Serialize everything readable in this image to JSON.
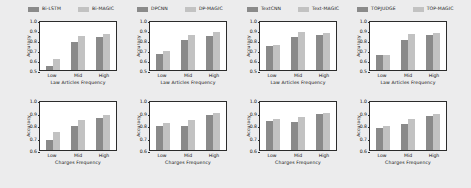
{
  "figure": {
    "background": "#ececed",
    "bar_colors": {
      "baseline": "#8a8a8a",
      "magic": "#c2c2c2"
    },
    "rows": 2,
    "cols": 4
  },
  "legends": [
    {
      "baseline": "Bi-LSTM",
      "magic": "Bi-MAGIC"
    },
    {
      "baseline": "DPCNN",
      "magic": "DP-MAGIC"
    },
    {
      "baseline": "TextCNN",
      "magic": "Text-MAGIC"
    },
    {
      "baseline": "TOPJUDGE",
      "magic": "TOP-MAGIC"
    }
  ],
  "chart_data": [
    {
      "type": "bar",
      "title": "",
      "xlabel": "Law Articles Frequency",
      "ylabel": "Accuracy",
      "categories": [
        "Low",
        "Mid",
        "High"
      ],
      "ylim": [
        0.5,
        1.0
      ],
      "yticks": [
        "0.5",
        "0.6",
        "0.7",
        "0.8",
        "0.9",
        "1.0"
      ],
      "grid": false,
      "legend_position": "above",
      "series": [
        {
          "name": "Bi-LSTM",
          "values": [
            0.54,
            0.78,
            0.83
          ]
        },
        {
          "name": "Bi-MAGIC",
          "values": [
            0.61,
            0.84,
            0.86
          ]
        }
      ]
    },
    {
      "type": "bar",
      "title": "",
      "xlabel": "Law Articles Frequency",
      "ylabel": "Accuracy",
      "categories": [
        "Low",
        "Mid",
        "High"
      ],
      "ylim": [
        0.5,
        1.0
      ],
      "yticks": [
        "0.5",
        "0.6",
        "0.7",
        "0.8",
        "0.9",
        "1.0"
      ],
      "grid": false,
      "legend_position": "above",
      "series": [
        {
          "name": "DPCNN",
          "values": [
            0.66,
            0.8,
            0.84
          ]
        },
        {
          "name": "DP-MAGIC",
          "values": [
            0.69,
            0.85,
            0.88
          ]
        }
      ]
    },
    {
      "type": "bar",
      "title": "",
      "xlabel": "Law Articles Frequency",
      "ylabel": "Accuracy",
      "categories": [
        "Low",
        "Mid",
        "High"
      ],
      "ylim": [
        0.5,
        1.0
      ],
      "yticks": [
        "0.5",
        "0.6",
        "0.7",
        "0.8",
        "0.9",
        "1.0"
      ],
      "grid": false,
      "legend_position": "above",
      "series": [
        {
          "name": "TextCNN",
          "values": [
            0.74,
            0.83,
            0.855
          ]
        },
        {
          "name": "Text-MAGIC",
          "values": [
            0.75,
            0.88,
            0.875
          ]
        }
      ]
    },
    {
      "type": "bar",
      "title": "",
      "xlabel": "Law Articles Frequency",
      "ylabel": "Accuracy",
      "categories": [
        "Low",
        "Mid",
        "High"
      ],
      "ylim": [
        0.5,
        1.0
      ],
      "yticks": [
        "0.5",
        "0.6",
        "0.7",
        "0.8",
        "0.9",
        "1.0"
      ],
      "grid": false,
      "legend_position": "above",
      "series": [
        {
          "name": "TOPJUDGE",
          "values": [
            0.65,
            0.8,
            0.85
          ]
        },
        {
          "name": "TOP-MAGIC",
          "values": [
            0.655,
            0.86,
            0.87
          ]
        }
      ]
    },
    {
      "type": "bar",
      "title": "",
      "xlabel": "Charges Frequency",
      "ylabel": "Accuracy",
      "categories": [
        "Low",
        "Mid",
        "High"
      ],
      "ylim": [
        0.6,
        1.0
      ],
      "yticks": [
        "0.6",
        "0.7",
        "0.8",
        "0.9",
        "1.0"
      ],
      "grid": false,
      "legend_position": "above",
      "series": [
        {
          "name": "Bi-LSTM",
          "values": [
            0.68,
            0.79,
            0.86
          ]
        },
        {
          "name": "Bi-MAGIC",
          "values": [
            0.745,
            0.84,
            0.88
          ]
        }
      ]
    },
    {
      "type": "bar",
      "title": "",
      "xlabel": "Charges Frequency",
      "ylabel": "Accuracy",
      "categories": [
        "Low",
        "Mid",
        "High"
      ],
      "ylim": [
        0.6,
        1.0
      ],
      "yticks": [
        "0.6",
        "0.7",
        "0.8",
        "0.9",
        "1.0"
      ],
      "grid": false,
      "legend_position": "above",
      "series": [
        {
          "name": "DPCNN",
          "values": [
            0.795,
            0.79,
            0.88
          ]
        },
        {
          "name": "DP-MAGIC",
          "values": [
            0.82,
            0.84,
            0.895
          ]
        }
      ]
    },
    {
      "type": "bar",
      "title": "",
      "xlabel": "Charges Frequency",
      "ylabel": "Accuracy",
      "categories": [
        "Low",
        "Mid",
        "High"
      ],
      "ylim": [
        0.6,
        1.0
      ],
      "yticks": [
        "0.6",
        "0.7",
        "0.8",
        "0.9",
        "1.0"
      ],
      "grid": false,
      "legend_position": "above",
      "series": [
        {
          "name": "TextCNN",
          "values": [
            0.835,
            0.825,
            0.885
          ]
        },
        {
          "name": "Text-MAGIC",
          "values": [
            0.845,
            0.865,
            0.895
          ]
        }
      ]
    },
    {
      "type": "bar",
      "title": "",
      "xlabel": "Charges Frequency",
      "ylabel": "Accuracy",
      "categories": [
        "Low",
        "Mid",
        "High"
      ],
      "ylim": [
        0.6,
        1.0
      ],
      "yticks": [
        "0.6",
        "0.7",
        "0.8",
        "0.9",
        "1.0"
      ],
      "grid": false,
      "legend_position": "above",
      "series": [
        {
          "name": "TOPJUDGE",
          "values": [
            0.775,
            0.81,
            0.875
          ]
        },
        {
          "name": "TOP-MAGIC",
          "values": [
            0.795,
            0.85,
            0.89
          ]
        }
      ]
    }
  ]
}
